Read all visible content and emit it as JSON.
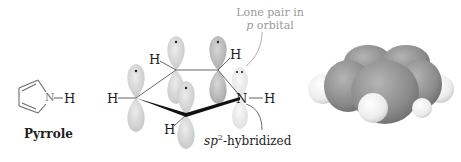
{
  "figure": {
    "skeletal": {
      "atoms": {
        "N": "N",
        "H": "H"
      },
      "name": "Pyrrole"
    },
    "orbital_diagram": {
      "atom_labels": {
        "h_left": "H",
        "h_top_left": "H",
        "h_top_right": "H",
        "h_bottom": "H",
        "n": "N",
        "h_n": "H"
      },
      "annotations": {
        "lone_pair_line1": "Lone pair in",
        "lone_pair_line2_italic": "p",
        "lone_pair_line2_rest": " orbital",
        "hybrid_prefix": "sp",
        "hybrid_sup": "2",
        "hybrid_suffix": "-hybridized"
      }
    },
    "space_filling_model": {
      "description": "Space-filling model of pyrrole",
      "colors": {
        "carbon": "#8c8c8c",
        "hydrogen": "#f2f2f2"
      }
    }
  }
}
